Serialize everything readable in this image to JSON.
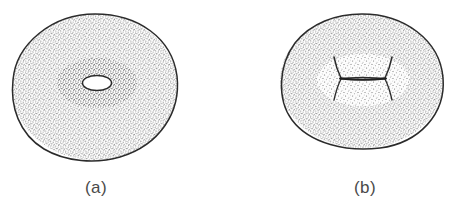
{
  "figure": {
    "background_color": "#ffffff",
    "ink_color": "#2b2b2b",
    "caption_color": "#4a4a4a",
    "stipple_color": "#555555",
    "panels": [
      {
        "id": "a",
        "caption": "(a)",
        "subject": "torus-with-open-hole",
        "caption_x": 96,
        "caption_y": 190,
        "body": {
          "center_x": 95,
          "center_y": 87,
          "radius_x": 83,
          "radius_y": 73
        },
        "hole": {
          "shape": "ellipse",
          "center_x": 97,
          "center_y": 83,
          "radius_x": 14,
          "radius_y": 7
        }
      },
      {
        "id": "b",
        "caption": "(b)",
        "subject": "torus-with-pinched-waist",
        "caption_x": 365,
        "caption_y": 190,
        "body": {
          "center_x": 362,
          "center_y": 81,
          "radius_x": 82,
          "radius_y": 67
        },
        "waist": {
          "shape": "hourglass",
          "left_x": 337,
          "right_x": 391,
          "center_y": 78,
          "flare": 22
        }
      }
    ]
  }
}
